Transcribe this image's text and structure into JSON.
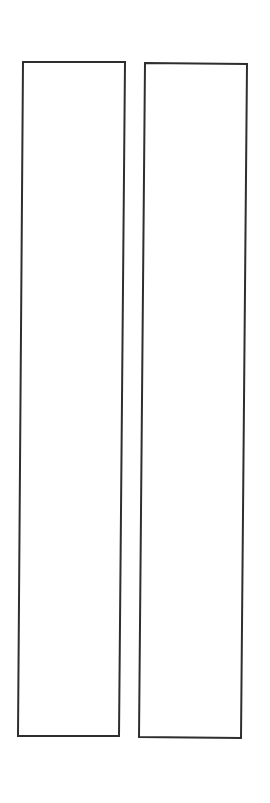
{
  "canvas": {
    "width": 270,
    "height": 803,
    "background": "#ffffff"
  },
  "style": {
    "stroke": "#2e2e2e",
    "stroke_width": 2,
    "fill": "#ffffff"
  },
  "shapes": [
    {
      "id": "left-panel",
      "points": [
        [
          23,
          62
        ],
        [
          125,
          62
        ],
        [
          119,
          736
        ],
        [
          18,
          736
        ]
      ]
    },
    {
      "id": "right-panel",
      "points": [
        [
          145,
          63
        ],
        [
          247,
          64
        ],
        [
          241,
          738
        ],
        [
          139,
          737
        ]
      ]
    }
  ]
}
